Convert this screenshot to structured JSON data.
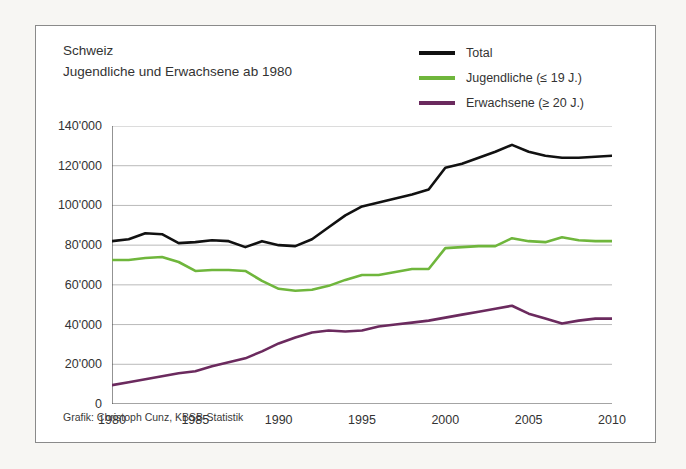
{
  "figure": {
    "title_line1": "Schweiz",
    "title_line2": "Jugendliche und Erwachsene ab 1980",
    "credit": "Grafik: Christoph Cunz, KBSB-Statistik",
    "background": "#ffffff",
    "page_background": "#f7f6f3",
    "border_color": "#8a8a8a"
  },
  "legend": {
    "position": "top-right",
    "items": [
      {
        "label": "Total",
        "color": "#111111"
      },
      {
        "label": "Jugendliche (≤ 19 J.)",
        "color": "#6fb63c"
      },
      {
        "label": "Erwachsene (≥ 20 J.)",
        "color": "#6b2a5e"
      }
    ]
  },
  "axes": {
    "y_ticks": [
      "0",
      "20'000",
      "40'000",
      "60'000",
      "80'000",
      "100'000",
      "120'000",
      "140'000"
    ],
    "y_tick_values": [
      0,
      20000,
      40000,
      60000,
      80000,
      100000,
      120000,
      140000
    ],
    "x_ticks": [
      "1980",
      "1985",
      "1990",
      "1995",
      "2000",
      "2005",
      "2010"
    ],
    "x_tick_values": [
      1980,
      1985,
      1990,
      1995,
      2000,
      2005,
      2010
    ],
    "grid": "horizontal",
    "gridline_color": "#b9b9b9",
    "axis_color": "#4a4a4a"
  },
  "chart_data": {
    "type": "line",
    "xlabel": "",
    "ylabel": "",
    "xlim": [
      1980,
      2010
    ],
    "ylim": [
      0,
      140000
    ],
    "grid": true,
    "legend_position": "top-right",
    "x": [
      1980,
      1981,
      1982,
      1983,
      1984,
      1985,
      1986,
      1987,
      1988,
      1989,
      1990,
      1991,
      1992,
      1993,
      1994,
      1995,
      1996,
      1997,
      1998,
      1999,
      2000,
      2001,
      2002,
      2003,
      2004,
      2005,
      2006,
      2007,
      2008,
      2009,
      2010
    ],
    "series": [
      {
        "name": "Total",
        "color": "#111111",
        "values": [
          82000,
          83000,
          86000,
          85500,
          81000,
          81500,
          82500,
          82000,
          79000,
          82000,
          80000,
          79500,
          83000,
          89000,
          95000,
          99500,
          101500,
          103500,
          105500,
          108000,
          119000,
          121000,
          124000,
          127000,
          130500,
          127000,
          125000,
          124000,
          124000,
          124500,
          125000
        ]
      },
      {
        "name": "Jugendliche (≤ 19 J.)",
        "color": "#6fb63c",
        "values": [
          72500,
          72500,
          73500,
          74000,
          71500,
          67000,
          67500,
          67500,
          67000,
          62000,
          58000,
          57000,
          57500,
          59500,
          62500,
          65000,
          65000,
          66500,
          68000,
          68000,
          78500,
          79000,
          79500,
          79500,
          83500,
          82000,
          81500,
          84000,
          82500,
          82000,
          82000
        ]
      },
      {
        "name": "Erwachsene (≥ 20 J.)",
        "color": "#6b2a5e",
        "values": [
          9500,
          11000,
          12500,
          14000,
          15500,
          16500,
          19000,
          21000,
          23000,
          26500,
          30500,
          33500,
          36000,
          37000,
          36500,
          37000,
          39000,
          40000,
          41000,
          42000,
          43500,
          45000,
          46500,
          48000,
          49500,
          45500,
          43000,
          40500,
          42000,
          43000,
          43000
        ]
      }
    ]
  }
}
